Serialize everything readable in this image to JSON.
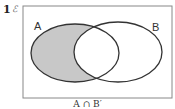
{
  "question": {
    "number": "1",
    "universal_set_symbol": "ℰ"
  },
  "diagram": {
    "type": "venn",
    "sets": [
      {
        "label": "A"
      },
      {
        "label": "B"
      }
    ],
    "shaded_region": "A only (A minus B)",
    "caption": "A ∩ B′",
    "colors": {
      "shading": "#c8c8c8",
      "outline": "#333333",
      "frame": "#888888"
    }
  }
}
